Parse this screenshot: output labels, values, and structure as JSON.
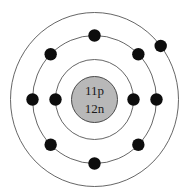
{
  "diagram": {
    "background_color": "#ffffff",
    "nucleus": {
      "name": "nucleus",
      "center_x": 94.5,
      "center_y": 99.5,
      "radius": 23,
      "fill_color": "#b8b8b8",
      "stroke_color": "#4a4a4a",
      "proton_label": "11p",
      "neutron_label": "12n",
      "proton_label_y": 92,
      "neutron_label_y": 110,
      "text_color": "#1a1a1a"
    },
    "shells": [
      {
        "name": "inner-shell",
        "index": 1,
        "radius_x": 39,
        "radius_y": 40,
        "electron_count": 2,
        "stroke_color": "#555555",
        "stroke_width": 0.9
      },
      {
        "name": "middle-shell",
        "index": 2,
        "radius_x": 62,
        "radius_y": 64,
        "electron_count": 8,
        "stroke_color": "#555555",
        "stroke_width": 0.9
      },
      {
        "name": "outer-shell",
        "index": 3,
        "radius_x": 84,
        "radius_y": 87,
        "electron_count": 1,
        "stroke_color": "#555555",
        "stroke_width": 0.9
      }
    ],
    "electron": {
      "name": "electron",
      "radius": 6.2,
      "fill_color": "#0d0d0d",
      "total_count": 11
    },
    "electron_positions": [
      {
        "shell": 1,
        "angle_deg": 180,
        "label": "inner-electron-left"
      },
      {
        "shell": 1,
        "angle_deg": 0,
        "label": "inner-electron-right"
      },
      {
        "shell": 2,
        "angle_deg": 90,
        "label": "middle-electron-top"
      },
      {
        "shell": 2,
        "angle_deg": 135,
        "label": "middle-electron-upper-left"
      },
      {
        "shell": 2,
        "angle_deg": 45,
        "label": "middle-electron-upper-right"
      },
      {
        "shell": 2,
        "angle_deg": 180,
        "label": "middle-electron-left"
      },
      {
        "shell": 2,
        "angle_deg": 0,
        "label": "middle-electron-right"
      },
      {
        "shell": 2,
        "angle_deg": 225,
        "label": "middle-electron-lower-left"
      },
      {
        "shell": 2,
        "angle_deg": 315,
        "label": "middle-electron-lower-right"
      },
      {
        "shell": 2,
        "angle_deg": 270,
        "label": "middle-electron-bottom"
      },
      {
        "shell": 3,
        "angle_deg": 38,
        "label": "outer-electron-upper-right"
      }
    ]
  }
}
